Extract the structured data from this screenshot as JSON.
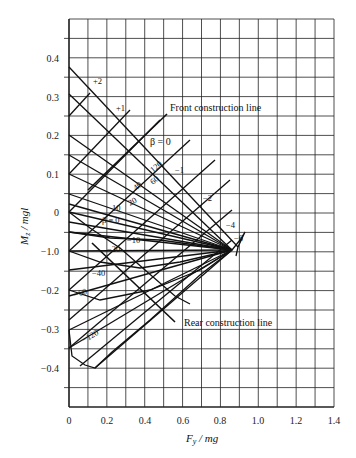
{
  "chart_data": {
    "type": "line",
    "title": "",
    "xlabel": "F_y / mg",
    "ylabel": "M_z / mgl",
    "xlim": [
      0,
      1.4
    ],
    "ylim": [
      -0.5,
      0.5
    ],
    "grid": true,
    "x_ticks": [
      "0",
      "0.2",
      "0.4",
      "0.6",
      "0.8",
      "1.0",
      "1.2",
      "1.4"
    ],
    "y_ticks": [
      "0.4",
      "0.3",
      "0.2",
      "0.1",
      "0",
      "-1.0",
      "-0.2",
      "-0.3",
      "-0.4"
    ],
    "series_family_steer": {
      "description": "Constant front-axle/steer lines (labels +2, +1, 0, -1, -2, -4, -6) converging near (0.85, -0.09)",
      "labels": [
        "+2",
        "+1",
        "β = 0",
        "-1",
        "-2",
        "-4",
        "-6"
      ]
    },
    "series_family_beta": {
      "description": "Constant sideslip lines labelled 120, 60, 40, 20, 10, β=0, -10, -20, -40, -60, -120",
      "labels": [
        "120",
        "60",
        "40",
        "20",
        "10",
        "β = 0",
        "-10",
        "-20",
        "-40",
        "-60",
        "-120"
      ]
    },
    "annotations": [
      {
        "text": "Front construction line",
        "x": 0.53,
        "y": 0.2
      },
      {
        "text": "Rear construction line",
        "x": 0.53,
        "y": -0.27
      }
    ],
    "convergence_point": {
      "x": 0.85,
      "y": -0.09
    }
  },
  "labels": {
    "x_axis_title_main": "F",
    "x_axis_title_sub": "y",
    "x_axis_title_rest": " / mg",
    "y_axis_title_main": "M",
    "y_axis_title_sub": "z",
    "y_axis_title_rest": " / mgl",
    "front_line": "Front construction line",
    "rear_line": "Rear construction line",
    "beta0_top": "β = 0",
    "beta0_mid": "β = 0",
    "plus2": "+2",
    "plus1": "+1",
    "minus1": "−1",
    "minus2": "−2",
    "minus4": "−4",
    "minus6": "−6",
    "b120": "120",
    "b60": "60",
    "b40": "40",
    "b20": "20",
    "b10": "10",
    "bm10": "−10",
    "bm20": "−20",
    "bm40": "−40",
    "bm60": "−60",
    "bm120": "−120"
  },
  "ticks": {
    "x": [
      "0",
      "0.2",
      "0.4",
      "0.6",
      "0.8",
      "1.0",
      "1.2",
      "1.4"
    ],
    "y": [
      "0.4",
      "0.3",
      "0.2",
      "0.1",
      "0",
      "−1.0",
      "−0.2",
      "−0.3",
      "−0.4"
    ]
  }
}
